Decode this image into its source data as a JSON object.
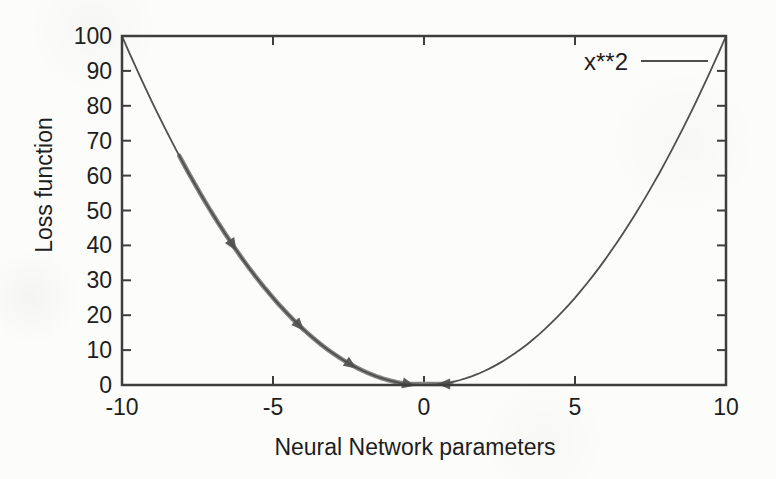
{
  "figure": {
    "background_color": "#fcfcfa",
    "axis_color": "#3e3e3e",
    "curve_color": "#4f4f4f",
    "descent_path_color": "#848484",
    "arrow_color": "#5a5a5a",
    "text_color": "#1e1e1e"
  },
  "chart_data": {
    "type": "line",
    "title": "",
    "xlabel": "Neural Network parameters",
    "ylabel": "Loss function",
    "xlim": [
      -10,
      10
    ],
    "ylim": [
      0,
      100
    ],
    "x_ticks": [
      -10,
      -5,
      0,
      5,
      10
    ],
    "y_ticks": [
      0,
      10,
      20,
      30,
      40,
      50,
      60,
      70,
      80,
      90,
      100
    ],
    "grid": false,
    "legend_position": "top-right",
    "legend": [
      {
        "label": "x**2"
      }
    ],
    "series": [
      {
        "name": "x**2",
        "kind": "function-curve",
        "expression": "x**2",
        "power": 2,
        "x_min": -10,
        "x_max": 10,
        "sample_points": [
          [
            -10,
            100
          ],
          [
            -8,
            64
          ],
          [
            -6,
            36
          ],
          [
            -4,
            16
          ],
          [
            -2,
            4
          ],
          [
            0,
            0
          ],
          [
            2,
            4
          ],
          [
            4,
            16
          ],
          [
            6,
            36
          ],
          [
            8,
            64
          ],
          [
            10,
            100
          ]
        ]
      },
      {
        "name": "gradient-descent-path",
        "kind": "thick-overlay-path",
        "description": "gradient descent steps sliding down the left branch of the parabola",
        "curve_segment_x": [
          -8.1,
          -0.55
        ],
        "step_points": [
          [
            -8.1,
            65.6
          ],
          [
            -6.35,
            40.3
          ],
          [
            -4.15,
            17.2
          ],
          [
            -2.45,
            6.0
          ],
          [
            -0.55,
            0.3
          ],
          [
            0.9,
            0.3
          ]
        ],
        "curve_arrows_x": [
          -6.35,
          -4.15,
          -2.45,
          -0.55
        ],
        "overshoot": {
          "x_end": 0.9,
          "y": 0.3
        },
        "return_arrow": {
          "x": 0.7,
          "y": 0.3,
          "direction": "left"
        }
      }
    ]
  }
}
